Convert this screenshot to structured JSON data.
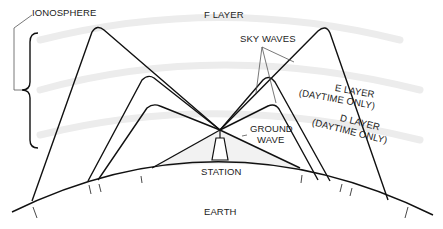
{
  "labels": {
    "ionosphere": "IONOSPHERE",
    "f_layer": "F LAYER",
    "sky_waves": "SKY WAVES",
    "e_layer": "E LAYER",
    "e_layer_note": "(DAYTIME ONLY)",
    "d_layer": "D LAYER",
    "d_layer_note": "(DAYTIME ONLY)",
    "ground_wave_1": "GROUND",
    "ground_wave_2": "WAVE",
    "station": "STATION",
    "earth": "EARTH"
  },
  "colors": {
    "line": "#111111",
    "layer_band": "#ececec",
    "text": "#222222"
  }
}
